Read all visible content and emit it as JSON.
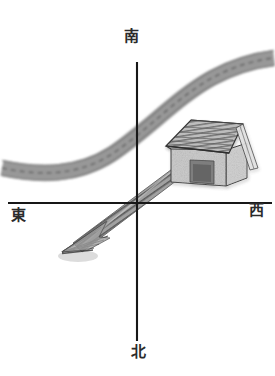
{
  "diagram": {
    "background_color": "#ffffff",
    "axis_color": "#1a1a1a",
    "ink_color": "#2b2b2b"
  },
  "compass": {
    "top": {
      "label": "南",
      "meaning": "south",
      "icon": "axis-tip-up"
    },
    "bottom": {
      "label": "北",
      "meaning": "north",
      "icon": "axis-tip-down"
    },
    "left": {
      "label": "東",
      "meaning": "east",
      "icon": "axis-tip-left"
    },
    "right": {
      "label": "西",
      "meaning": "west",
      "icon": "axis-tip-right"
    }
  },
  "axes": {
    "origin": {
      "x": 137,
      "y": 203
    },
    "vertical": {
      "x": 137,
      "y1": 62,
      "y2": 341,
      "width": 2
    },
    "horizontal": {
      "y": 203,
      "x1": 8,
      "x2": 272,
      "width": 2
    }
  },
  "features": {
    "road": {
      "name": "curved-road",
      "fill": "#a3a3a3",
      "edge": "#8a8a8a",
      "dash": "#6e6e6e",
      "width": 15,
      "path": "M 2,168 C 40,176 78,176 112,154 C 148,130 176,98 212,78 C 238,64 258,60 274,58"
    },
    "house": {
      "name": "house-sketch",
      "roof_fill": "#b9b9b9",
      "roof_stripe": "#5f5f5f",
      "wall_fill": "#cfcfcf",
      "wall_side": "#9d9d9d",
      "outline": "#3c3c3c",
      "bounds": {
        "x": 163,
        "y": 118,
        "w": 84,
        "h": 65
      }
    },
    "arrow": {
      "name": "direction-arrow",
      "fill": "#9a9a9a",
      "stripe": "#3a3a3a",
      "from": {
        "x": 201,
        "y": 152
      },
      "to": {
        "x": 66,
        "y": 252
      },
      "bearing": "from house toward lower-left quadrant"
    }
  }
}
